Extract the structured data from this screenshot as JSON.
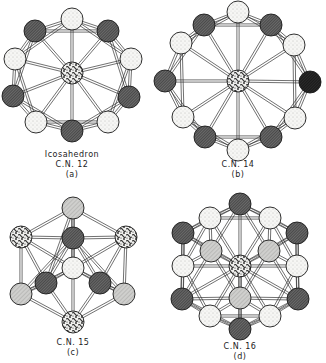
{
  "panels": [
    {
      "id": "a",
      "title": "Icosahedron",
      "cn": "C.N. 12",
      "letter": "(a)",
      "center": {
        "x": 72,
        "y": 73,
        "fill": "mottled"
      },
      "radius": 11,
      "atoms": [
        {
          "x": 72,
          "y": 19,
          "fill": "light"
        },
        {
          "x": 108,
          "y": 31,
          "fill": "dark"
        },
        {
          "x": 131,
          "y": 59,
          "fill": "light"
        },
        {
          "x": 129,
          "y": 97,
          "fill": "dark"
        },
        {
          "x": 108,
          "y": 122,
          "fill": "light"
        },
        {
          "x": 72,
          "y": 131,
          "fill": "dark"
        },
        {
          "x": 36,
          "y": 122,
          "fill": "light"
        },
        {
          "x": 13,
          "y": 96,
          "fill": "dark"
        },
        {
          "x": 15,
          "y": 59,
          "fill": "light"
        },
        {
          "x": 35,
          "y": 31,
          "fill": "dark"
        }
      ]
    },
    {
      "id": "b",
      "title": "",
      "cn": "C.N. 14",
      "letter": "(b)",
      "center": {
        "x": 238,
        "y": 81,
        "fill": "mottled"
      },
      "radius": 11,
      "atoms": [
        {
          "x": 238,
          "y": 12,
          "fill": "light"
        },
        {
          "x": 271,
          "y": 25,
          "fill": "dark"
        },
        {
          "x": 294,
          "y": 45,
          "fill": "light"
        },
        {
          "x": 310,
          "y": 82,
          "fill": "black"
        },
        {
          "x": 295,
          "y": 118,
          "fill": "light"
        },
        {
          "x": 271,
          "y": 137,
          "fill": "dark"
        },
        {
          "x": 238,
          "y": 150,
          "fill": "light"
        },
        {
          "x": 205,
          "y": 137,
          "fill": "dark"
        },
        {
          "x": 183,
          "y": 117,
          "fill": "light"
        },
        {
          "x": 165,
          "y": 81,
          "fill": "dark"
        },
        {
          "x": 181,
          "y": 43,
          "fill": "light"
        },
        {
          "x": 204,
          "y": 25,
          "fill": "dark"
        }
      ]
    },
    {
      "id": "c",
      "title": "",
      "cn": "C.N. 15",
      "letter": "(c)",
      "radius": 11,
      "atoms": [
        {
          "x": 73,
          "y": 208,
          "fill": "gray"
        },
        {
          "x": 21,
          "y": 237,
          "fill": "mottled"
        },
        {
          "x": 73,
          "y": 238,
          "fill": "dark"
        },
        {
          "x": 126,
          "y": 237,
          "fill": "mottled"
        },
        {
          "x": 73,
          "y": 268,
          "fill": "light"
        },
        {
          "x": 46,
          "y": 283,
          "fill": "dark"
        },
        {
          "x": 100,
          "y": 283,
          "fill": "dark"
        },
        {
          "x": 21,
          "y": 294,
          "fill": "gray"
        },
        {
          "x": 124,
          "y": 294,
          "fill": "gray"
        },
        {
          "x": 73,
          "y": 322,
          "fill": "mottled"
        }
      ]
    },
    {
      "id": "d",
      "title": "",
      "cn": "C.N. 16",
      "letter": "(d)",
      "center": {
        "x": 240,
        "y": 266,
        "fill": "mottled"
      },
      "radius": 11,
      "atoms": [
        {
          "x": 240,
          "y": 204,
          "fill": "dark"
        },
        {
          "x": 210,
          "y": 218,
          "fill": "light"
        },
        {
          "x": 270,
          "y": 218,
          "fill": "light"
        },
        {
          "x": 183,
          "y": 233,
          "fill": "dark"
        },
        {
          "x": 297,
          "y": 233,
          "fill": "dark"
        },
        {
          "x": 211,
          "y": 251,
          "fill": "gray"
        },
        {
          "x": 269,
          "y": 251,
          "fill": "gray"
        },
        {
          "x": 183,
          "y": 266,
          "fill": "light"
        },
        {
          "x": 297,
          "y": 266,
          "fill": "light"
        },
        {
          "x": 240,
          "y": 298,
          "fill": "gray"
        },
        {
          "x": 182,
          "y": 299,
          "fill": "dark"
        },
        {
          "x": 298,
          "y": 299,
          "fill": "dark"
        },
        {
          "x": 210,
          "y": 316,
          "fill": "light"
        },
        {
          "x": 270,
          "y": 316,
          "fill": "light"
        },
        {
          "x": 240,
          "y": 329,
          "fill": "dark"
        }
      ]
    }
  ],
  "captions": {
    "a_title": "Icosahedron",
    "a_cn": "C.N. 12",
    "a_letter": "(a)",
    "b_cn": "C.N. 14",
    "b_letter": "(b)",
    "c_cn": "C.N. 15",
    "c_letter": "(c)",
    "d_cn": "C.N. 16",
    "d_letter": "(d)"
  },
  "colors": {
    "light": "#f4f4f2",
    "gray": "#c8c8c6",
    "dark": "#555555",
    "black": "#1e1e1e",
    "mottled": "#8a8a8a",
    "bond": "#333333"
  }
}
